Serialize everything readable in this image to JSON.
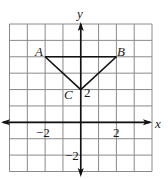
{
  "diagram": {
    "type": "coordinate-plane",
    "x_range": [
      -4,
      4
    ],
    "y_range": [
      -3,
      6
    ],
    "axis_labels": {
      "x": "x",
      "y": "y"
    },
    "tick_labels": [
      {
        "axis": "x",
        "value": -2,
        "text": "−2"
      },
      {
        "axis": "x",
        "value": 2,
        "text": "2"
      },
      {
        "axis": "y",
        "value": 2,
        "text": "2"
      },
      {
        "axis": "y",
        "value": -2,
        "text": "−2"
      }
    ],
    "points": [
      {
        "name": "A",
        "x": -2,
        "y": 4
      },
      {
        "name": "B",
        "x": 2,
        "y": 4
      },
      {
        "name": "C",
        "x": 0,
        "y": 2
      }
    ],
    "segments": [
      [
        "A",
        "B"
      ],
      [
        "A",
        "C"
      ],
      [
        "B",
        "C"
      ]
    ],
    "colors": {
      "grid": "#8a8a8a",
      "axes": "#111111",
      "shape": "#111111"
    }
  },
  "labels": {
    "x_axis": "x",
    "y_axis": "y",
    "point_a": "A",
    "point_b": "B",
    "point_c": "C",
    "tick_x_neg2": "−2",
    "tick_x_2": "2",
    "tick_y_2": "2",
    "tick_y_neg2": "−2"
  }
}
